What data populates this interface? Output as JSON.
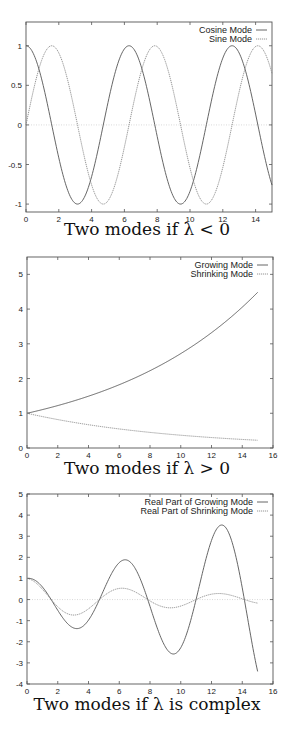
{
  "chart_data": [
    {
      "type": "line",
      "title": "",
      "caption": "Two modes if λ < 0",
      "xlabel": "",
      "ylabel": "",
      "xlim": [
        0,
        15
      ],
      "ylim": [
        -1.1,
        1.3
      ],
      "xticks": [
        0,
        2,
        4,
        6,
        8,
        10,
        12,
        14
      ],
      "yticks": [
        -1,
        -0.5,
        0,
        0.5,
        1
      ],
      "ytick_labels": [
        "-1",
        "-0.5",
        "0",
        "0.5",
        "1"
      ],
      "zero_line": true,
      "legend_position": "top-right",
      "frame": {
        "top": 22,
        "bottom": 212,
        "left": 26,
        "right": 272
      },
      "series": [
        {
          "name": "Cosine Mode",
          "style": "solid",
          "func": "cos(x)",
          "x": [
            0,
            1.57,
            3.14,
            4.71,
            6.28,
            7.85,
            9.42,
            11.0,
            12.57,
            14.14,
            15
          ],
          "values": [
            1,
            0,
            -1,
            0,
            1,
            0,
            -1,
            0,
            1,
            0,
            -0.76
          ]
        },
        {
          "name": "Sine Mode",
          "style": "dotted",
          "func": "sin(x)",
          "x": [
            0,
            1.57,
            3.14,
            4.71,
            6.28,
            7.85,
            9.42,
            11.0,
            12.57,
            14.14,
            15
          ],
          "values": [
            0,
            1,
            0,
            -1,
            0,
            1,
            0,
            -1,
            0,
            1,
            0.65
          ]
        }
      ]
    },
    {
      "type": "line",
      "title": "",
      "caption": "Two modes if λ > 0",
      "xlabel": "",
      "ylabel": "",
      "xlim": [
        0,
        16
      ],
      "ylim": [
        0,
        5.5
      ],
      "xticks": [
        0,
        2,
        4,
        6,
        8,
        10,
        12,
        14,
        16
      ],
      "yticks": [
        0,
        1,
        2,
        3,
        4,
        5
      ],
      "ytick_labels": [
        "0",
        "1",
        "2",
        "3",
        "4",
        "5"
      ],
      "zero_line": false,
      "legend_position": "top-right",
      "frame": {
        "top": 257,
        "bottom": 448,
        "left": 27,
        "right": 273
      },
      "series": [
        {
          "name": "Growing Mode",
          "style": "solid",
          "func": "exp(0.1x)",
          "x": [
            0,
            2,
            4,
            6,
            8,
            10,
            12,
            14,
            15
          ],
          "values": [
            1.0,
            1.22,
            1.49,
            1.82,
            2.23,
            2.72,
            3.32,
            4.06,
            4.48
          ]
        },
        {
          "name": "Shrinking Mode",
          "style": "dotted",
          "func": "exp(-0.1x)",
          "x": [
            0,
            2,
            4,
            6,
            8,
            10,
            12,
            14,
            15
          ],
          "values": [
            1.0,
            0.82,
            0.67,
            0.55,
            0.45,
            0.37,
            0.3,
            0.25,
            0.22
          ]
        }
      ]
    },
    {
      "type": "line",
      "title": "",
      "caption": "Two modes if λ is complex",
      "xlabel": "",
      "ylabel": "",
      "xlim": [
        0,
        16
      ],
      "ylim": [
        -4,
        5
      ],
      "xticks": [
        0,
        2,
        4,
        6,
        8,
        10,
        12,
        14,
        16
      ],
      "yticks": [
        -4,
        -3,
        -2,
        -1,
        0,
        1,
        2,
        3,
        4,
        5
      ],
      "ytick_labels": [
        "-4",
        "-3",
        "-2",
        "-1",
        "0",
        "1",
        "2",
        "3",
        "4",
        "5"
      ],
      "zero_line": true,
      "legend_position": "top-right",
      "frame": {
        "top": 494,
        "bottom": 684,
        "left": 27,
        "right": 273
      },
      "series": [
        {
          "name": "Real Part of Growing Mode",
          "style": "solid",
          "func": "exp(0.1x)cos(x)",
          "x": [
            0,
            1.57,
            3.14,
            4.71,
            6.28,
            7.85,
            9.42,
            11.0,
            12.57,
            14.14,
            15
          ],
          "values": [
            1.0,
            0,
            -1.37,
            0,
            1.87,
            0,
            -2.57,
            0,
            3.51,
            0,
            -3.41
          ]
        },
        {
          "name": "Real Part of Shrinking Mode",
          "style": "dotted",
          "func": "exp(-0.1x)cos(x)",
          "x": [
            0,
            1.57,
            3.14,
            4.71,
            6.28,
            7.85,
            9.42,
            11.0,
            12.57,
            14.14,
            15
          ],
          "values": [
            1.0,
            0,
            -0.73,
            0,
            0.53,
            0,
            -0.39,
            0,
            0.28,
            0,
            -0.17
          ]
        }
      ]
    }
  ]
}
